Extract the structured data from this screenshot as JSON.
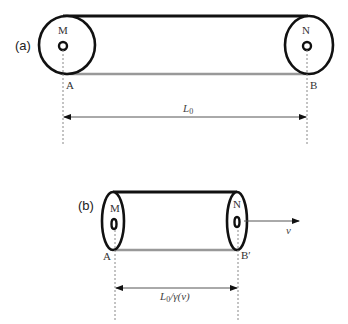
{
  "figure": {
    "panel_a": {
      "label": "(a)",
      "left_end_label": "M",
      "right_end_label": "N",
      "left_point_label": "A",
      "right_point_label": "B",
      "length_label_main": "L",
      "length_label_sub": "0"
    },
    "panel_b": {
      "label": "(b)",
      "left_end_label": "M",
      "right_end_label": "N",
      "left_point_label": "A",
      "right_point_label": "B′",
      "length_label_main": "L",
      "length_label_sub": "0",
      "length_label_tail": "/γ(v)",
      "velocity_label": "v"
    },
    "colors": {
      "outline": "#111111",
      "bottom_edge": "#999999",
      "dimension_line": "#555555",
      "dashed_guide": "#888888"
    }
  }
}
